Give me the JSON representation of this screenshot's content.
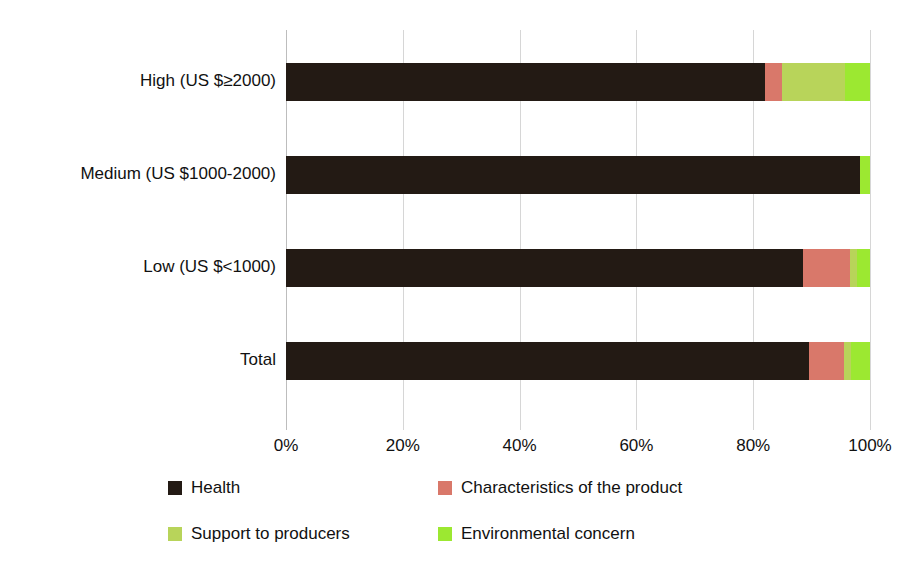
{
  "chart_data": {
    "type": "bar",
    "orientation": "horizontal",
    "stacked": true,
    "normalized_percent": true,
    "title": "",
    "xlabel": "",
    "ylabel": "",
    "xlim": [
      0,
      100
    ],
    "xtick_labels": [
      "0%",
      "20%",
      "40%",
      "60%",
      "80%",
      "100%"
    ],
    "xtick_values": [
      0,
      20,
      40,
      60,
      80,
      100
    ],
    "grid": true,
    "legend_position": "bottom",
    "categories": [
      "High (US $≥2000)",
      "Medium (US $1000-2000)",
      "Low (US $<1000)",
      "Total"
    ],
    "series": [
      {
        "name": "Health",
        "color": "#231a14",
        "values": [
          82.0,
          98.3,
          88.5,
          89.5
        ]
      },
      {
        "name": "Characteristics of the product",
        "color": "#d9786a",
        "values": [
          3.0,
          0.0,
          8.0,
          6.0
        ]
      },
      {
        "name": "Support to producers",
        "color": "#b8d45a",
        "values": [
          10.8,
          0.0,
          1.2,
          1.2
        ]
      },
      {
        "name": "Environmental concern",
        "color": "#9ce831",
        "values": [
          4.2,
          1.7,
          2.3,
          3.3
        ]
      }
    ]
  },
  "axis": {
    "ticks": [
      {
        "label": "0%",
        "value": 0
      },
      {
        "label": "20%",
        "value": 20
      },
      {
        "label": "40%",
        "value": 40
      },
      {
        "label": "60%",
        "value": 60
      },
      {
        "label": "80%",
        "value": 80
      },
      {
        "label": "100%",
        "value": 100
      }
    ]
  },
  "categories": [
    {
      "label": "High (US $≥2000)"
    },
    {
      "label": "Medium (US $1000-2000)"
    },
    {
      "label": "Low (US $<1000)"
    },
    {
      "label": "Total"
    }
  ],
  "legend": {
    "items": [
      {
        "label": "Health",
        "color": "#231a14"
      },
      {
        "label": "Characteristics of the product",
        "color": "#d9786a"
      },
      {
        "label": "Support to producers",
        "color": "#b8d45a"
      },
      {
        "label": "Environmental concern",
        "color": "#9ce831"
      }
    ]
  }
}
